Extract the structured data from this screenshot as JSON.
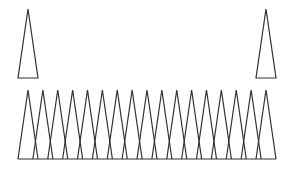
{
  "diagram": {
    "stroke_color": "#333333",
    "background": "#ffffff",
    "top_triangles": [
      {
        "apex": [
          28,
          9
        ],
        "base_left": [
          18,
          78
        ],
        "base_right": [
          38,
          78
        ]
      },
      {
        "apex": [
          266,
          9
        ],
        "base_left": [
          256,
          78
        ],
        "base_right": [
          276,
          78
        ]
      }
    ],
    "bottom_row": {
      "count": 17,
      "first_peak_x": 28,
      "last_peak_x": 266,
      "peak_y": 90,
      "baseline_y": 159,
      "half_width": 10,
      "baseline_x_start": 18,
      "baseline_x_end": 276
    }
  }
}
